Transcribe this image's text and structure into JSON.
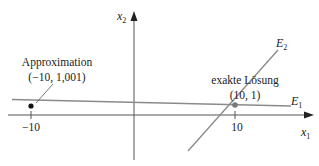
{
  "diagram": {
    "axes": {
      "x_label": "x",
      "x_label_sub": "1",
      "y_label": "x",
      "y_label_sub": "2",
      "x_ticks": [
        {
          "value": -10,
          "label": "−10"
        },
        {
          "value": 10,
          "label": "10"
        }
      ]
    },
    "lines": [
      {
        "name": "E",
        "sub": "1",
        "description": "nearly horizontal line"
      },
      {
        "name": "E",
        "sub": "2",
        "description": "steep line through solution"
      }
    ],
    "points": {
      "approximation": {
        "title": "Approximation",
        "coords": "(−10, 1,001)"
      },
      "exact_solution": {
        "title": "exakte Lösung",
        "coords": "(10, 1)"
      }
    },
    "colors": {
      "axis": "#555555",
      "line": "#8a8a8a",
      "point_approx": "#111111",
      "point_exact": "#7a7a7a",
      "text": "#222222"
    }
  }
}
